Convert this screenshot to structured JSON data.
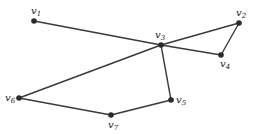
{
  "graph": {
    "vertices": [
      {
        "id": "v1",
        "name": "v",
        "sub": "1",
        "x": 34,
        "y": 21,
        "lx": 31,
        "ly": 14
      },
      {
        "id": "v2",
        "name": "v",
        "sub": "2",
        "x": 239,
        "y": 23,
        "lx": 236,
        "ly": 16
      },
      {
        "id": "v3",
        "name": "v",
        "sub": "3",
        "x": 161,
        "y": 45,
        "lx": 155,
        "ly": 38
      },
      {
        "id": "v4",
        "name": "v",
        "sub": "4",
        "x": 221,
        "y": 55,
        "lx": 220,
        "ly": 67
      },
      {
        "id": "v5",
        "name": "v",
        "sub": "5",
        "x": 171,
        "y": 100,
        "lx": 176,
        "ly": 103
      },
      {
        "id": "v6",
        "name": "v",
        "sub": "6",
        "x": 19,
        "y": 98,
        "lx": 5,
        "ly": 101
      },
      {
        "id": "v7",
        "name": "v",
        "sub": "7",
        "x": 111,
        "y": 115,
        "lx": 108,
        "ly": 128
      }
    ],
    "edges": [
      [
        "v1",
        "v3"
      ],
      [
        "v3",
        "v4"
      ],
      [
        "v2",
        "v4"
      ],
      [
        "v2",
        "v3"
      ],
      [
        "v3",
        "v6"
      ],
      [
        "v3",
        "v5"
      ],
      [
        "v5",
        "v7"
      ],
      [
        "v7",
        "v6"
      ]
    ],
    "colors": {
      "edge": "#3a3a3a",
      "vertex": "#2a2a2a",
      "label": "#222222"
    }
  }
}
